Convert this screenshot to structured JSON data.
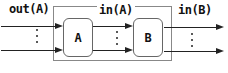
{
  "diagram": {
    "labels": {
      "out_a": "out(A)",
      "in_a": "in(A)",
      "in_b": "in(B)"
    },
    "nodes": [
      {
        "id": "A",
        "label": "A"
      },
      {
        "id": "B",
        "label": "B"
      }
    ],
    "edges": [
      {
        "from": "input",
        "to": "A"
      },
      {
        "from": "A",
        "to": "B"
      },
      {
        "from": "B",
        "to": "output"
      }
    ],
    "multiplicity_symbol": "⋮",
    "colors": {
      "line": "#222222",
      "box_border": "#666666",
      "outer_border": "#888888",
      "text": "#111111",
      "background": "#ffffff"
    }
  }
}
